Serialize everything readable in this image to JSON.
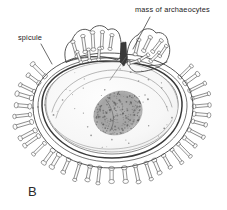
{
  "figure": {
    "panel_letter": "B",
    "background_color": "#ffffff",
    "ink_color": "#3a3a3a"
  },
  "labels": [
    {
      "id": "spicule",
      "text": "spicule",
      "text_x": 18,
      "text_y": 40,
      "anchor": "start",
      "leader": "M 41 44 L 52 64"
    },
    {
      "id": "mass-of-archaeocytes",
      "text": "mass of archaeocytes",
      "text_x": 135,
      "text_y": 12,
      "anchor": "start",
      "leader": "M 150 17 L 133 49"
    }
  ],
  "internal_pointer": {
    "id": "archaeocyte-pointer",
    "leader": "M 126 57 L 110 80"
  },
  "shell": {
    "outline_fill": "#f4f4f4",
    "cavity_fill": "#fafafa",
    "rim_dark": "#8d8d8d",
    "rim_mid": "#b8b8b8"
  },
  "archaeocyte_mass": {
    "id": "archaeocyte-mass",
    "center_x": 118,
    "center_y": 113,
    "radius_x": 25,
    "radius_y": 21,
    "rotation": -28,
    "fill": "#9a9a9a",
    "stipple_color": "#5a5a5a",
    "stipple_count": 430
  },
  "cavity_stipple": {
    "color": "#7d7d7d",
    "count": 70
  },
  "spicule_rings": {
    "outer_count": 46,
    "collar_count": 13,
    "color": "#454545"
  }
}
